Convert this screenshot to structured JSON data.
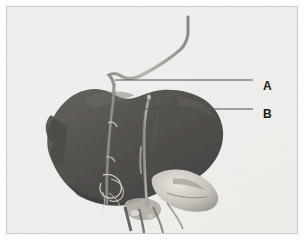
{
  "figure": {
    "kind": "anatomical-photograph",
    "background_color": "#eeeeec",
    "frame_border_color": "#c9c9c6",
    "specimen_color": "#23211f",
    "tissue_color": "#b9b4ab",
    "leader_line_color": "#1f1f1f"
  },
  "callouts": [
    {
      "id": "a",
      "label": "A",
      "leader": {
        "x1": 114,
        "y1": 79,
        "x2": 252,
        "y2": 79
      }
    },
    {
      "id": "b",
      "label": "B",
      "leader": {
        "x1": 142,
        "y1": 108,
        "x2": 252,
        "y2": 108
      }
    }
  ],
  "labels": {
    "a": "A",
    "b": "B"
  }
}
